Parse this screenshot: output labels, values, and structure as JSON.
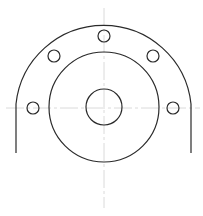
{
  "drawing": {
    "type": "flange-front-view",
    "colors": {
      "background": "#ffffff",
      "outline": "#2a2a2a",
      "centerline": "#d0d0d0"
    },
    "center": {
      "x": 104,
      "y": 107
    },
    "outer_arc": {
      "radius": 88,
      "left_x": 16,
      "right_x": 191,
      "bottom_y": 153
    },
    "middle_circle": {
      "radius": 55
    },
    "bore": {
      "radius": 18
    },
    "bolt_holes": [
      {
        "x": 33,
        "y": 108,
        "r": 6
      },
      {
        "x": 54,
        "y": 56,
        "r": 6
      },
      {
        "x": 104,
        "y": 36,
        "r": 6
      },
      {
        "x": 153,
        "y": 56,
        "r": 6
      },
      {
        "x": 173,
        "y": 108,
        "r": 6
      }
    ],
    "centerlines": {
      "horizontal": {
        "x1": 6,
        "x2": 200,
        "y": 108
      },
      "vertical": {
        "x": 104,
        "y1": 8,
        "y2": 208
      }
    }
  }
}
